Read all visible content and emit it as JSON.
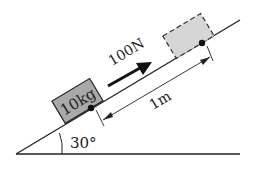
{
  "diagram": {
    "type": "inclined-plane-physics",
    "angle_label": "30°",
    "mass_label": "10kg",
    "force_label": "100N",
    "distance_label": "1m",
    "colors": {
      "line": "#222222",
      "block_fill": "#a9a9a9",
      "ghost_fill": "#d6d6d6",
      "background": "#ffffff"
    }
  }
}
